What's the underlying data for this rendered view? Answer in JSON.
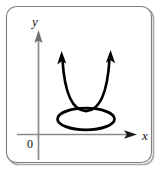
{
  "figure": {
    "width": 160,
    "height": 171,
    "background_color": "#ffffff",
    "frame": {
      "stroke_color": "#8c8c8c",
      "shadow_color": "#9a9a9a",
      "corner_radius": 10,
      "x": 6,
      "y": 6,
      "width": 145,
      "height": 156
    },
    "axes": {
      "stroke_color": "#8a8a8a",
      "x_axis": {
        "label": "x",
        "label_x": 142,
        "label_y": 139,
        "start_x": 17,
        "end_x": 134,
        "y": 134
      },
      "y_axis": {
        "label": "y",
        "label_x": 34,
        "label_y": 24,
        "x": 38,
        "start_y": 160,
        "end_y": 34
      },
      "origin": {
        "label": "0",
        "label_x": 29,
        "label_y": 147
      }
    },
    "curves": [
      {
        "name": "parabola",
        "type": "parabola",
        "stroke_color": "#000000",
        "stroke_width": 2.6,
        "vertex_x": 86,
        "vertex_y": 111,
        "left_end_x": 62,
        "left_end_y": 56,
        "right_end_x": 110,
        "right_end_y": 55,
        "arrowheads": [
          "left-end-up",
          "right-end-up"
        ]
      },
      {
        "name": "ellipse",
        "type": "ellipse",
        "stroke_color": "#000000",
        "stroke_width": 2.6,
        "center_x": 86,
        "center_y": 119,
        "radius_x": 28,
        "radius_y": 11
      }
    ]
  }
}
